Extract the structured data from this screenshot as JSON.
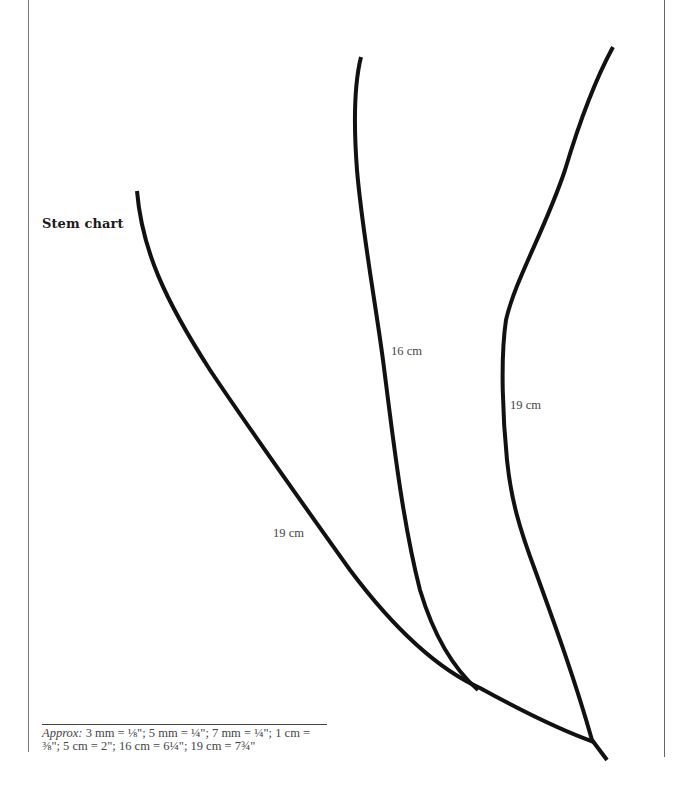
{
  "title": "Stem chart",
  "stems": [
    {
      "id": "left",
      "label": "19 cm",
      "length_cm": 19
    },
    {
      "id": "middle",
      "label": "16 cm",
      "length_cm": 16
    },
    {
      "id": "right",
      "label": "19 cm",
      "length_cm": 19
    }
  ],
  "caption": {
    "lead": "Approx:",
    "line1": " 3 mm = ⅛\"; 5 mm = ¼\"; 7 mm = ¼\"; 1 cm =",
    "line2": "⅜\"; 5 cm = 2\"; 16 cm = 6¼\"; 19 cm = 7¾\""
  },
  "colors": {
    "stroke": "#111111",
    "text": "#444444",
    "border": "#777777"
  }
}
